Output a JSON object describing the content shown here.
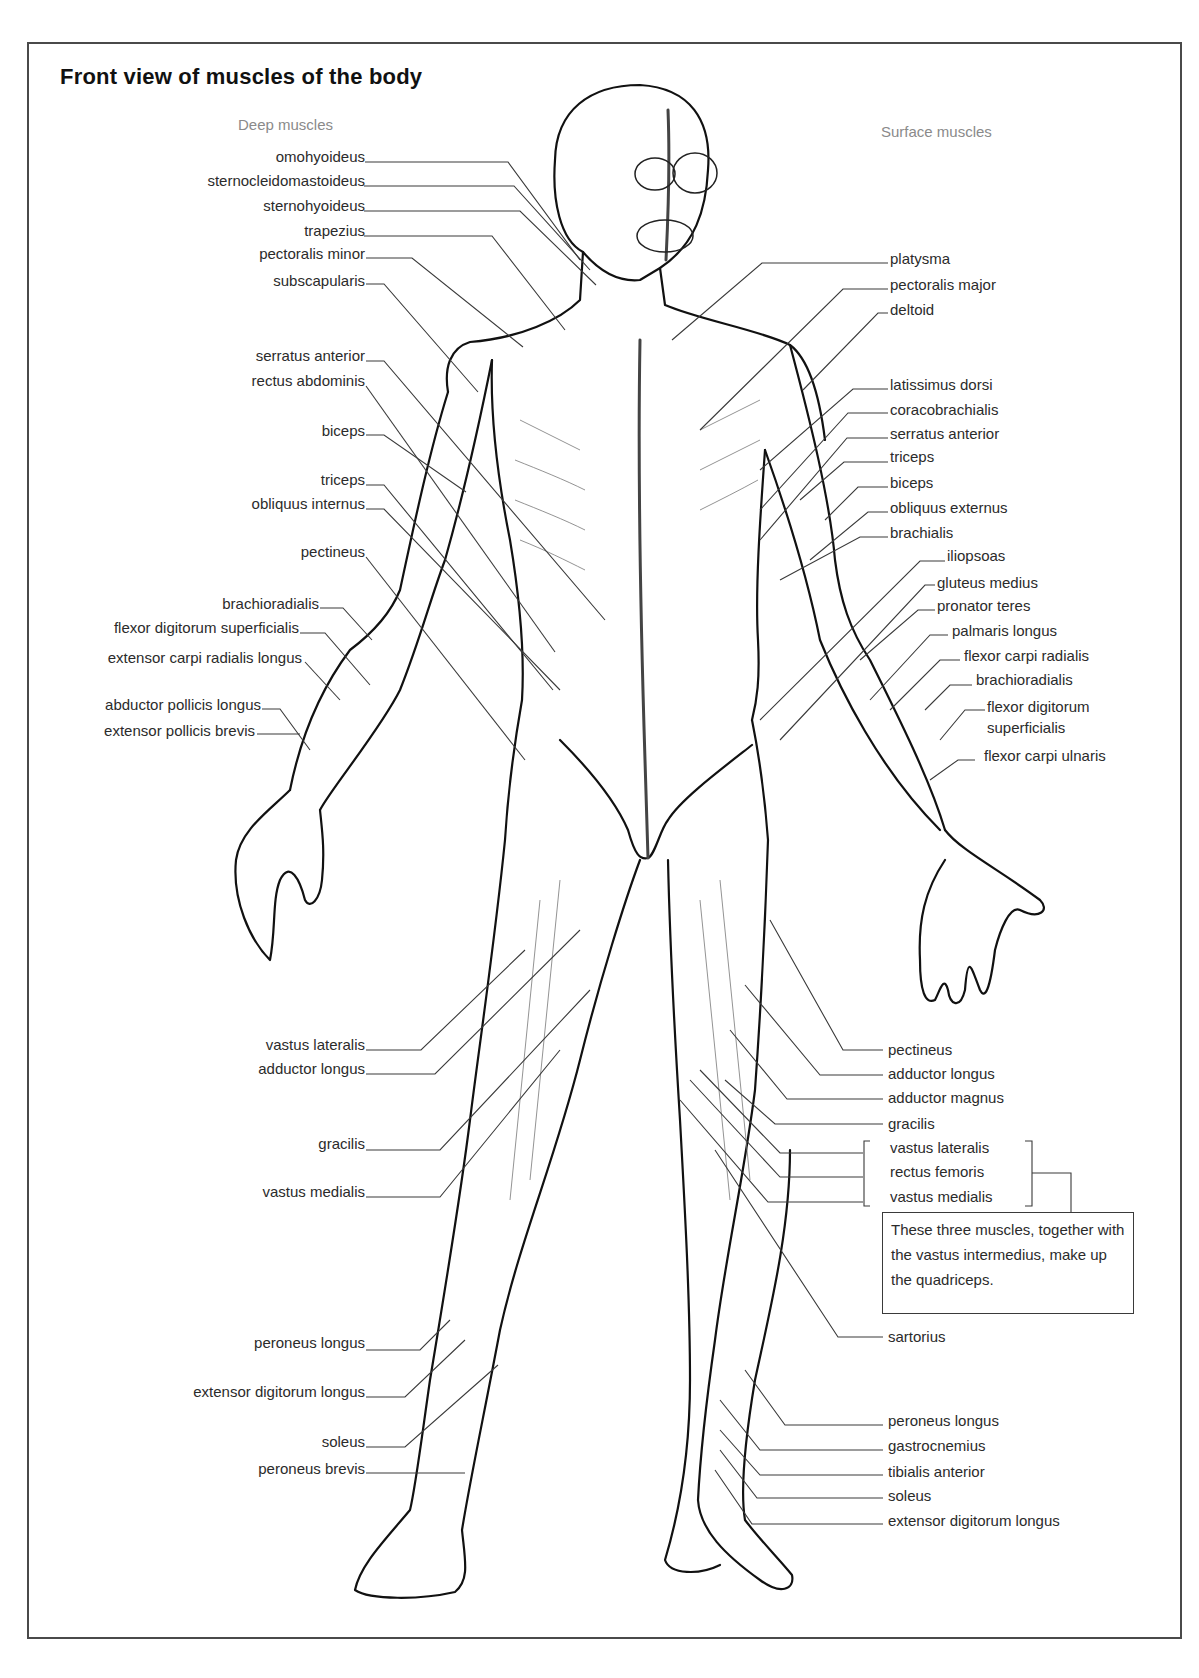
{
  "title": "Front view of muscles of the body",
  "headings": {
    "deep": "Deep muscles",
    "surface": "Surface muscles"
  },
  "deep_muscles": [
    {
      "label": "omohyoideus",
      "y": 157
    },
    {
      "label": "sternocleidomastoideus",
      "y": 181
    },
    {
      "label": "sternohyoideus",
      "y": 206
    },
    {
      "label": "trapezius",
      "y": 231
    },
    {
      "label": "pectoralis minor",
      "y": 254
    },
    {
      "label": "subscapularis",
      "y": 281
    },
    {
      "label": "serratus anterior",
      "y": 356
    },
    {
      "label": "rectus abdominis",
      "y": 381
    },
    {
      "label": "biceps",
      "y": 431
    },
    {
      "label": "triceps",
      "y": 480
    },
    {
      "label": "obliquus internus",
      "y": 504
    },
    {
      "label": "pectineus",
      "y": 552
    },
    {
      "label": "brachioradialis",
      "y": 604
    },
    {
      "label": "flexor digitorum superficialis",
      "y": 628
    },
    {
      "label": "extensor carpi radialis longus",
      "y": 658
    },
    {
      "label": "abductor pollicis longus",
      "y": 705
    },
    {
      "label": "extensor pollicis brevis",
      "y": 731
    },
    {
      "label": "vastus lateralis",
      "y": 1045
    },
    {
      "label": "adductor longus",
      "y": 1069
    },
    {
      "label": "gracilis",
      "y": 1144
    },
    {
      "label": "vastus medialis",
      "y": 1192
    },
    {
      "label": "peroneus longus",
      "y": 1343
    },
    {
      "label": "extensor digitorum longus",
      "y": 1392
    },
    {
      "label": "soleus",
      "y": 1442
    },
    {
      "label": "peroneus brevis",
      "y": 1469
    }
  ],
  "surface_muscles": [
    {
      "label": "platysma",
      "y": 259
    },
    {
      "label": "pectoralis major",
      "y": 285
    },
    {
      "label": "deltoid",
      "y": 310
    },
    {
      "label": "latissimus dorsi",
      "y": 385
    },
    {
      "label": "coracobrachialis",
      "y": 410
    },
    {
      "label": "serratus anterior",
      "y": 434
    },
    {
      "label": "triceps",
      "y": 457
    },
    {
      "label": "biceps",
      "y": 483
    },
    {
      "label": "obliquus externus",
      "y": 508
    },
    {
      "label": "brachialis",
      "y": 533
    },
    {
      "label": "iliopsoas",
      "y": 556
    },
    {
      "label": "gluteus medius",
      "y": 583
    },
    {
      "label": "pronator teres",
      "y": 606
    },
    {
      "label": "palmaris longus",
      "y": 631
    },
    {
      "label": "flexor carpi radialis",
      "y": 656
    },
    {
      "label": "brachioradialis",
      "y": 680
    },
    {
      "label": "flexor digitorum superficialis",
      "y": 705
    },
    {
      "label": "flexor carpi ulnaris",
      "y": 756
    },
    {
      "label": "pectineus",
      "y": 1050
    },
    {
      "label": "adductor longus",
      "y": 1074
    },
    {
      "label": "adductor magnus",
      "y": 1098
    },
    {
      "label": "gracilis",
      "y": 1124
    },
    {
      "label": "vastus lateralis",
      "y": 1148
    },
    {
      "label": "rectus femoris",
      "y": 1172
    },
    {
      "label": "vastus medialis",
      "y": 1197
    },
    {
      "label": "sartorius",
      "y": 1337
    },
    {
      "label": "peroneus longus",
      "y": 1421
    },
    {
      "label": "gastrocnemius",
      "y": 1446
    },
    {
      "label": "tibialis anterior",
      "y": 1472
    },
    {
      "label": "soleus",
      "y": 1496
    },
    {
      "label": "extensor digitorum longus",
      "y": 1521
    }
  ],
  "quadriceps_note": "These three muscles, together with the vastus intermedius, make up the quadriceps.",
  "colors": {
    "line": "#3a3a3a",
    "outline": "#111111",
    "heading_gray": "#8a8a8a",
    "text": "#2b2b2b"
  }
}
